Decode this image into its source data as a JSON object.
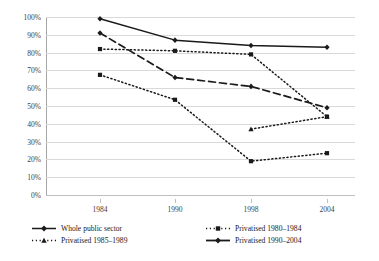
{
  "chart_data": {
    "type": "line",
    "title": "",
    "subtitle": "",
    "xlabel": "",
    "ylabel": "",
    "categories": [
      "1984",
      "1990",
      "1998",
      "2004"
    ],
    "ylim": [
      0,
      100
    ],
    "ytick_labels": [
      "0%",
      "10%",
      "20%",
      "30%",
      "40%",
      "50%",
      "60%",
      "70%",
      "80%",
      "90%",
      "100%"
    ],
    "ytick_values": [
      0,
      10,
      20,
      30,
      40,
      50,
      60,
      70,
      80,
      90,
      100
    ],
    "grid": true,
    "legend_position": "bottom",
    "value_suffix": "%",
    "series": [
      {
        "name": "Whole public sector",
        "style": "solid",
        "marker": "diamond",
        "color": "#1a1a1a",
        "values": [
          99,
          87,
          84,
          83
        ]
      },
      {
        "name": "Privatised 1980–1984",
        "style": "dotted",
        "marker": "square",
        "color": "#1a1a1a",
        "values": [
          82,
          81,
          79,
          44
        ]
      },
      {
        "name": "Privatised 1985–1989",
        "style": "dotted",
        "marker": "square",
        "color": "#1a1a1a",
        "values": [
          67.5,
          53.5,
          19,
          23.5
        ]
      },
      {
        "name": "Privatised 1990–2004",
        "style": "dashed",
        "marker": "diamond",
        "color": "#1a1a1a",
        "values": [
          91,
          66,
          61,
          49
        ]
      }
    ],
    "extra_series": [
      {
        "name": "Privatised 1980–1984 continuation",
        "style": "dotted",
        "marker": "triangle",
        "color": "#1a1a1a",
        "values": [
          null,
          null,
          37,
          44
        ]
      }
    ]
  },
  "legend": {
    "row1": [
      {
        "label": "Whole public sector",
        "style": "solid",
        "marker": "diamond"
      },
      {
        "label": "Privatised 1980–1984",
        "style": "dotted",
        "marker": "square"
      }
    ],
    "row2": [
      {
        "label": "Privatised 1985–1989",
        "style": "dotted",
        "marker": "triangle"
      },
      {
        "label": "Privatised 1990–2004",
        "style": "solid-dash",
        "marker": "diamond"
      }
    ]
  }
}
